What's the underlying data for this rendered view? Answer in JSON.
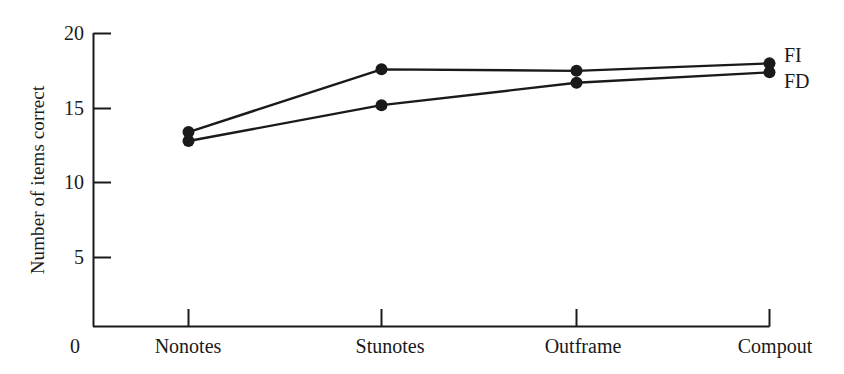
{
  "chart_data": {
    "type": "line",
    "title": "",
    "xlabel": "",
    "ylabel": "Number of items correct",
    "categories": [
      "Nonotes",
      "Stunotes",
      "Outframe",
      "Compout"
    ],
    "series": [
      {
        "name": "FI",
        "values": [
          13.4,
          17.6,
          17.5,
          18.0
        ]
      },
      {
        "name": "FD",
        "values": [
          12.8,
          15.2,
          16.7,
          17.4
        ]
      }
    ],
    "ylim": [
      0,
      20
    ],
    "yticks": [
      5,
      10,
      15,
      20
    ],
    "ytick_labels": [
      "5",
      "10",
      "15",
      "20"
    ],
    "origin_label": "0",
    "grid": false,
    "legend_position": "right-end-of-line",
    "marker": "filled-circle",
    "line_color": "#1a1a1a",
    "axis_color": "#1a1a1a",
    "background_color": "#ffffff"
  },
  "axis": {
    "y_title": "Number of items correct",
    "origin": "0",
    "ticks_y": [
      "20",
      "15",
      "10",
      "5"
    ],
    "ticks_x": [
      "Nonotes",
      "Stunotes",
      "Outframe",
      "Compout"
    ]
  },
  "legend": {
    "fi": "FI",
    "fd": "FD"
  }
}
